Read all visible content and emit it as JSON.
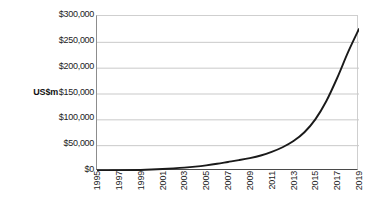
{
  "chart_data": {
    "type": "line",
    "title": "",
    "subtitle": "",
    "xlabel": "",
    "ylabel": "US$m",
    "ylim": [
      0,
      300000
    ],
    "xlim": [
      1995,
      2019
    ],
    "grid": true,
    "legend": false,
    "y_ticks": [
      {
        "value": 300000,
        "label": "$300,000"
      },
      {
        "value": 250000,
        "label": "$250,000"
      },
      {
        "value": 200000,
        "label": "$200,000"
      },
      {
        "value": 150000,
        "label": "$150,000"
      },
      {
        "value": 100000,
        "label": "$100,000"
      },
      {
        "value": 50000,
        "label": "$50,000"
      },
      {
        "value": 0,
        "label": "$0"
      }
    ],
    "x_tick_labels": [
      "1995",
      "1997",
      "1999",
      "2001",
      "2003",
      "2005",
      "2007",
      "2009",
      "2011",
      "2013",
      "2015",
      "2017",
      "2019"
    ],
    "x": [
      1995,
      1996,
      1997,
      1998,
      1999,
      2000,
      2001,
      2002,
      2003,
      2004,
      2005,
      2006,
      2007,
      2008,
      2009,
      2010,
      2011,
      2012,
      2013,
      2014,
      2015,
      2016,
      2017,
      2018,
      2019
    ],
    "values": [
      500,
      700,
      1000,
      1400,
      2000,
      2800,
      3800,
      5000,
      6500,
      8500,
      11000,
      14000,
      17500,
      21000,
      25000,
      30000,
      37000,
      46000,
      58000,
      75000,
      100000,
      135000,
      180000,
      230000,
      275000
    ],
    "series": [
      {
        "name": "US$m",
        "color": "#1a1a1a",
        "values": [
          500,
          700,
          1000,
          1400,
          2000,
          2800,
          3800,
          5000,
          6500,
          8500,
          11000,
          14000,
          17500,
          21000,
          25000,
          30000,
          37000,
          46000,
          58000,
          75000,
          100000,
          135000,
          180000,
          230000,
          275000
        ]
      }
    ],
    "colors": {
      "line": "#1a1a1a",
      "grid": "#c9c9c9",
      "axis": "#4a4a4a",
      "background": "#ffffff",
      "text": "#1c1c1c"
    }
  }
}
